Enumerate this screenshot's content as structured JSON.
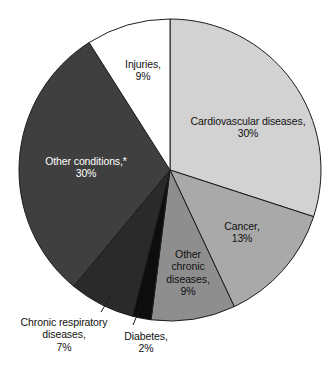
{
  "chart_data": {
    "type": "pie",
    "title": "",
    "subtitle": "",
    "xlabel": "",
    "ylabel": "",
    "legend_position": "none",
    "grid": false,
    "units": "percent",
    "start_angle_deg": 0,
    "direction": "clockwise",
    "categories": [
      "Cardiovascular diseases",
      "Cancer",
      "Other chronic diseases",
      "Diabetes",
      "Chronic respiratory diseases",
      "Other conditions",
      "Injuries"
    ],
    "values": [
      30,
      13,
      9,
      2,
      7,
      30,
      9
    ],
    "colors": [
      "#d2d2d2",
      "#a9a9a9",
      "#8e8e8e",
      "#0d0d0d",
      "#2a2a2a",
      "#3f3f3f",
      "#ffffff"
    ],
    "slices": [
      {
        "name": "Cardiovascular diseases",
        "value": 30,
        "value_label": "30%",
        "color": "#d2d2d2",
        "label_color": "dark",
        "start_deg": 0,
        "end_deg": 108
      },
      {
        "name": "Cancer",
        "value": 13,
        "value_label": "13%",
        "color": "#a9a9a9",
        "label_color": "dark",
        "start_deg": 108,
        "end_deg": 154.8
      },
      {
        "name": "Other chronic diseases",
        "value": 9,
        "value_label": "9%",
        "color": "#8e8e8e",
        "label_color": "dark",
        "start_deg": 154.8,
        "end_deg": 187.2
      },
      {
        "name": "Diabetes",
        "value": 2,
        "value_label": "2%",
        "color": "#0d0d0d",
        "label_color": "dark",
        "start_deg": 187.2,
        "end_deg": 194.4
      },
      {
        "name": "Chronic respiratory diseases",
        "value": 7,
        "value_label": "7%",
        "color": "#2a2a2a",
        "label_color": "dark",
        "start_deg": 194.4,
        "end_deg": 219.6
      },
      {
        "name": "Other conditions",
        "value": 30,
        "value_label": "30%",
        "color": "#3f3f3f",
        "label_color": "light",
        "start_deg": 219.6,
        "end_deg": 327.6
      },
      {
        "name": "Injuries",
        "value": 9,
        "value_label": "9%",
        "color": "#ffffff",
        "label_color": "dark",
        "start_deg": 327.6,
        "end_deg": 360
      }
    ]
  },
  "labels": {
    "cardiovascular": {
      "line1": "Cardiovascular diseases,",
      "line2": "30%"
    },
    "cancer": {
      "line1": "Cancer,",
      "line2": "13%"
    },
    "other_chronic": {
      "line1": "Other",
      "line2": "chronic",
      "line3": "diseases,",
      "line4": "9%"
    },
    "diabetes": {
      "line1": "Diabetes,",
      "line2": "2%"
    },
    "chronic_respiratory": {
      "line1": "Chronic respiratory",
      "line2": "diseases,",
      "line3": "7%"
    },
    "other_conditions": {
      "line1": "Other conditions,*",
      "line2": "30%"
    },
    "injuries": {
      "line1": "Injuries,",
      "line2": "9%"
    }
  },
  "geometry": {
    "center_x": 170,
    "center_y": 170,
    "radius": 151
  }
}
